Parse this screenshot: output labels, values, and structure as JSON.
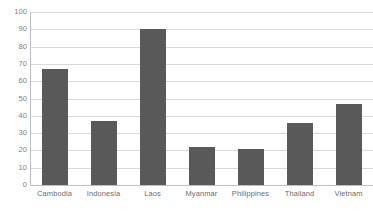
{
  "chart_data": {
    "type": "bar",
    "title": "",
    "subtitle": "",
    "xlabel": "",
    "ylabel": "",
    "categories": [
      "Cambodia",
      "Indonesia",
      "Laos",
      "Myanmar",
      "Philippines",
      "Thailand",
      "Vietnam"
    ],
    "values": [
      67,
      37,
      90,
      22,
      21,
      36,
      47
    ],
    "series": [
      {
        "name": "",
        "values": [
          67,
          37,
          90,
          22,
          21,
          36,
          47
        ]
      }
    ],
    "ylim": [
      0,
      100
    ],
    "ytick_labels": [
      "100",
      "90",
      "80",
      "70",
      "60",
      "50",
      "40",
      "30",
      "20",
      "10",
      "0"
    ],
    "ytick_values": [
      100,
      90,
      80,
      70,
      60,
      50,
      40,
      30,
      20,
      10,
      0
    ],
    "ytick_interval": 10,
    "grid": true,
    "grid_axis": "y",
    "legend": false,
    "legend_position": "none",
    "annotations": [],
    "colors": {
      "bar": "#595959",
      "gridline": "#d9d9d9",
      "axis_line": "#bfbfbf",
      "tick_label": "#808080",
      "category_label": "#6d6d6d",
      "background": "#ffffff"
    }
  }
}
